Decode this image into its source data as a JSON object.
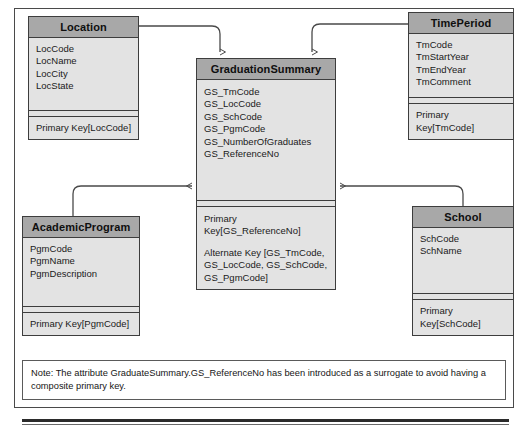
{
  "diagram": {
    "entities": [
      {
        "id": "location",
        "name": "Location",
        "attributes": [
          "LocCode",
          "LocName",
          "LocCity",
          "LocState"
        ],
        "keys": [
          "Primary Key[LocCode]"
        ]
      },
      {
        "id": "timeperiod",
        "name": "TimePeriod",
        "attributes": [
          "TmCode",
          "TmStartYear",
          "TmEndYear",
          "TmComment"
        ],
        "keys": [
          "Primary Key[TmCode]"
        ]
      },
      {
        "id": "graduationsummary",
        "name": "GraduationSummary",
        "attributes": [
          "GS_TmCode",
          "GS_LocCode",
          "GS_SchCode",
          "GS_PgmCode",
          "GS_NumberOfGraduates",
          "GS_ReferenceNo"
        ],
        "keys": [
          "Primary\nKey[GS_ReferenceNo]",
          "Alternate Key [GS_TmCode,\nGS_LocCode, GS_SchCode,\nGS_PgmCode]"
        ]
      },
      {
        "id": "academicprogram",
        "name": "AcademicProgram",
        "attributes": [
          "PgmCode",
          "PgmName",
          "PgmDescription"
        ],
        "keys": [
          "Primary Key[PgmCode]"
        ]
      },
      {
        "id": "school",
        "name": "School",
        "attributes": [
          "SchCode",
          "SchName"
        ],
        "keys": [
          "Primary Key[SchCode]"
        ]
      }
    ],
    "relationships": [
      {
        "from": "location",
        "to": "graduationsummary",
        "name": "location-to-graduationsummary"
      },
      {
        "from": "timeperiod",
        "to": "graduationsummary",
        "name": "timeperiod-to-graduationsummary"
      },
      {
        "from": "academicprogram",
        "to": "graduationsummary",
        "name": "academicprogram-to-graduationsummary"
      },
      {
        "from": "school",
        "to": "graduationsummary",
        "name": "school-to-graduationsummary"
      }
    ],
    "note": "Note: The attribute GraduateSummary.GS_ReferenceNo has been introduced as a surrogate to avoid having a composite primary key.",
    "colors": {
      "entity_header_fill": "#a8a8a8",
      "entity_body_fill": "#e3e3e3",
      "entity_border": "#3d3d3d",
      "frame_border": "#4a4a4a",
      "connector": "#4a4a4a",
      "note_border": "#5a5a5a",
      "text": "#161616"
    }
  }
}
